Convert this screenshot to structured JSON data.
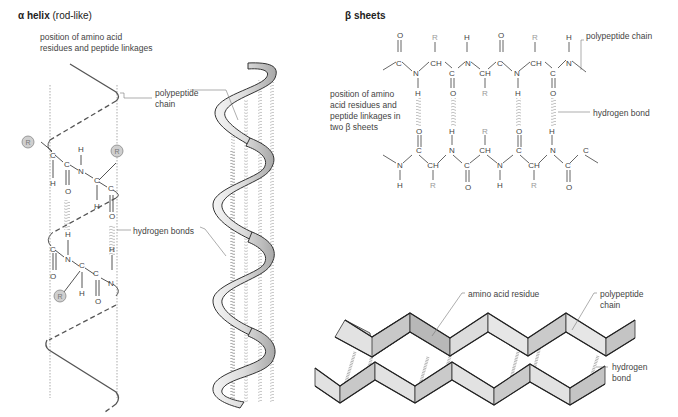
{
  "alpha_helix": {
    "title_bold": "α helix",
    "title_rest": " (rod-like)",
    "label_position": [
      "position of amino acid",
      "residues and peptide linkages"
    ],
    "label_polypeptide": [
      "polypeptide",
      "chain"
    ],
    "label_hbonds": "hydrogen bonds",
    "residue_symbol": "R",
    "atoms": {
      "C": "C",
      "N": "N",
      "O": "O",
      "H": "H"
    }
  },
  "beta_sheets": {
    "title": "β sheets",
    "label_polypeptide": "polypeptide chain",
    "label_hbond": "hydrogen bond",
    "label_position": [
      "position of amino",
      "acid residues and",
      "peptide linkages in",
      "two β sheets"
    ],
    "top_chain": {
      "upper_row": [
        "O",
        "R",
        "H",
        "O",
        "R",
        "H"
      ],
      "backbone": [
        "C",
        "N",
        "CH",
        "C",
        "N",
        "CH",
        "C",
        "N"
      ],
      "lower_row": [
        "H",
        "O",
        "R",
        "H",
        "O"
      ]
    },
    "bottom_chain": {
      "upper_row": [
        "O",
        "H",
        "R",
        "O",
        "H"
      ],
      "backbone": [
        "N",
        "C",
        "CH",
        "N",
        "C",
        "CH",
        "N",
        "C",
        "CH",
        "N",
        "C",
        "C"
      ],
      "lower_row": [
        "H",
        "R",
        "O",
        "H",
        "R",
        "O"
      ]
    }
  },
  "pleated_sheet": {
    "label_residue": "amino acid residue",
    "label_polypeptide": [
      "polypeptide",
      "chain"
    ],
    "label_hbond": [
      "hydrogen",
      "bond"
    ]
  },
  "colors": {
    "line": "#444444",
    "residue_fill": "#cccccc",
    "sheet_light": "#e2e2e2",
    "sheet_dark": "#b5b5b5",
    "text_muted": "#888888"
  }
}
